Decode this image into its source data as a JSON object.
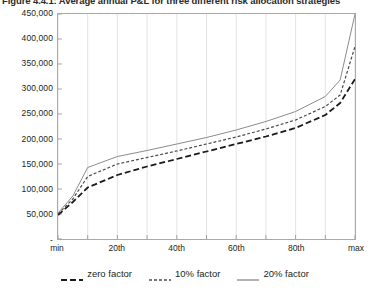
{
  "title": "Figure 4.4.1: Average annual P&L for three different risk allocation strategies",
  "axis": {
    "y_ticks": [
      "450,000",
      "400,000",
      "350,000",
      "300,000",
      "250,000",
      "200,000",
      "150,000",
      "100,000",
      "50,000",
      "-"
    ],
    "x_ticks": [
      "min",
      "20th",
      "40th",
      "60th",
      "80th",
      "max"
    ]
  },
  "legend": {
    "items": [
      {
        "label": "zero factor",
        "style": "long-dash",
        "color": "#1a1a1a"
      },
      {
        "label": "10% factor",
        "style": "short-dash",
        "color": "#3a3a3a"
      },
      {
        "label": "20% factor",
        "style": "solid",
        "color": "#8a8a8a"
      }
    ]
  },
  "chart_data": {
    "type": "line",
    "title": "Figure 4.4.1: Average annual P&L for three different risk allocation strategies",
    "xlabel": "",
    "ylabel": "",
    "ylim": [
      0,
      450000
    ],
    "yticks": [
      0,
      50000,
      100000,
      150000,
      200000,
      250000,
      300000,
      350000,
      400000,
      450000
    ],
    "grid": true,
    "legend_position": "bottom",
    "x": [
      "min",
      "5th",
      "10th",
      "20th",
      "30th",
      "40th",
      "50th",
      "60th",
      "70th",
      "80th",
      "90th",
      "95th",
      "max"
    ],
    "xtick_labels": [
      "min",
      "20th",
      "40th",
      "60th",
      "80th",
      "max"
    ],
    "series": [
      {
        "name": "zero factor",
        "style": "long-dash",
        "values": [
          48000,
          74000,
          103000,
          128000,
          145000,
          160000,
          175000,
          190000,
          205000,
          222000,
          248000,
          272000,
          320000
        ]
      },
      {
        "name": "10% factor",
        "style": "short-dash",
        "values": [
          50000,
          80000,
          125000,
          150000,
          163000,
          176000,
          190000,
          204000,
          220000,
          238000,
          265000,
          288000,
          385000
        ]
      },
      {
        "name": "20% factor",
        "style": "solid",
        "values": [
          52000,
          86000,
          143000,
          165000,
          177000,
          190000,
          203000,
          218000,
          235000,
          255000,
          285000,
          318000,
          450000
        ]
      }
    ]
  }
}
